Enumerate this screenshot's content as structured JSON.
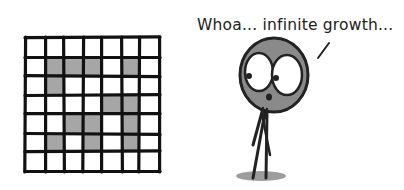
{
  "caption": {
    "speech_text": "Whoa... infinite growth..."
  },
  "grid": {
    "rows": 7,
    "cols": 7,
    "shaded_cells": [
      [
        1,
        1
      ],
      [
        1,
        2
      ],
      [
        1,
        3
      ],
      [
        1,
        5
      ],
      [
        2,
        1
      ],
      [
        3,
        4
      ],
      [
        3,
        5
      ],
      [
        4,
        2
      ],
      [
        4,
        3
      ],
      [
        4,
        5
      ],
      [
        5,
        1
      ],
      [
        5,
        3
      ],
      [
        5,
        5
      ]
    ],
    "line_color": "#111111",
    "shade_color": "#a6a6a6",
    "empty_color": "#ffffff"
  },
  "character": {
    "head_color": "#8a8a8a",
    "outline_color": "#222222",
    "shadow_color": "#8c8c8c"
  }
}
